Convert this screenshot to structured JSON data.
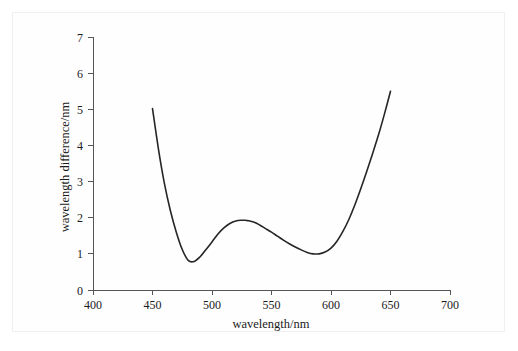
{
  "figure": {
    "background_color": "#ffffff",
    "frame_color": "#f0f0f0",
    "curve_color": "#262626",
    "axis_color": "#555555"
  },
  "chart_data": {
    "type": "line",
    "title": "",
    "xlabel": "wavelength/nm",
    "ylabel": "wavelength difference/nm",
    "xlim": [
      400,
      700
    ],
    "ylim": [
      0,
      7
    ],
    "xticks": [
      400,
      450,
      500,
      550,
      600,
      650,
      700
    ],
    "xtick_labels": [
      "400",
      "450",
      "500",
      "550",
      "600",
      "650",
      "700"
    ],
    "yticks": [
      0,
      1,
      2,
      3,
      4,
      5,
      6,
      7
    ],
    "ytick_labels": [
      "0",
      "1",
      "2",
      "3",
      "4",
      "5",
      "6",
      "7"
    ],
    "grid": false,
    "legend": null,
    "series": [
      {
        "name": "wavelength difference",
        "x": [
          450,
          455,
          460,
          465,
          470,
          475,
          480,
          485,
          490,
          495,
          500,
          505,
          510,
          515,
          520,
          525,
          528,
          530,
          535,
          540,
          545,
          550,
          555,
          560,
          565,
          570,
          575,
          580,
          585,
          590,
          595,
          600,
          605,
          610,
          615,
          620,
          625,
          630,
          635,
          640,
          645,
          650
        ],
        "y": [
          5.02,
          3.9,
          2.95,
          2.2,
          1.6,
          1.12,
          0.82,
          0.79,
          0.92,
          1.12,
          1.33,
          1.55,
          1.72,
          1.84,
          1.91,
          1.93,
          1.93,
          1.92,
          1.88,
          1.8,
          1.7,
          1.6,
          1.49,
          1.38,
          1.28,
          1.19,
          1.11,
          1.04,
          1.0,
          1.0,
          1.05,
          1.16,
          1.35,
          1.62,
          1.95,
          2.35,
          2.8,
          3.28,
          3.78,
          4.3,
          4.88,
          5.5
        ]
      }
    ],
    "annotations": {
      "left_endpoint": {
        "x": 450,
        "y": 5.02
      },
      "first_minimum": {
        "x": 482,
        "y": 0.79
      },
      "local_maximum": {
        "x": 528,
        "y": 1.93
      },
      "second_minimum": {
        "x": 587,
        "y": 1.0
      },
      "right_endpoint": {
        "x": 650,
        "y": 5.5
      }
    }
  }
}
